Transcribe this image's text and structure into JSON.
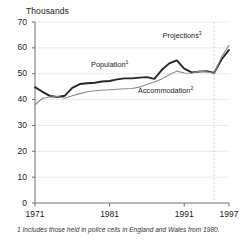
{
  "chart_data": {
    "type": "line",
    "title": "Thousands",
    "xlabel": "",
    "ylabel": "Thousands",
    "xlim": [
      1971,
      1997
    ],
    "ylim": [
      0,
      70
    ],
    "xticks": [
      "1971",
      "1981",
      "1991",
      "1997"
    ],
    "xtick_values": [
      1971,
      1981,
      1991,
      1997
    ],
    "yticks": [
      "0",
      "10",
      "20",
      "30",
      "40",
      "50",
      "60",
      "70"
    ],
    "ytick_values": [
      0,
      10,
      20,
      30,
      40,
      50,
      60,
      70
    ],
    "grid": true,
    "grid_axis": "y",
    "legend": "inline-annotations",
    "projection_start_year": 1995,
    "annotations": [
      {
        "text": "Projections",
        "superscript": "3",
        "x_year": 1991.6,
        "y_value": 64.5
      },
      {
        "text": "Population",
        "superscript": "1",
        "x_year": 1982.0,
        "y_value": 53.5
      },
      {
        "text": "Accommodation",
        "superscript": "2",
        "x_year": 1988.3,
        "y_value": 43.2
      }
    ],
    "x": [
      1971,
      1972,
      1973,
      1974,
      1975,
      1976,
      1977,
      1978,
      1979,
      1980,
      1981,
      1982,
      1983,
      1984,
      1985,
      1986,
      1987,
      1988,
      1989,
      1990,
      1991,
      1992,
      1993,
      1994,
      1995,
      1996,
      1997
    ],
    "series": [
      {
        "name": "Population",
        "superscript": "1",
        "color": "#262626",
        "width": 1.9,
        "values": [
          44.8,
          43.0,
          41.4,
          41.0,
          41.5,
          44.5,
          46.0,
          46.3,
          46.5,
          47.0,
          47.2,
          47.8,
          48.2,
          48.2,
          48.5,
          48.7,
          48.0,
          51.5,
          54.0,
          55.2,
          52.0,
          50.5,
          50.8,
          51.0,
          50.3,
          55.5,
          59.2
        ]
      },
      {
        "name": "Accommodation",
        "superscript": "2",
        "color": "#8a8a8a",
        "width": 1.1,
        "values": [
          38.0,
          40.5,
          41.0,
          41.2,
          40.5,
          41.5,
          42.3,
          43.0,
          43.4,
          43.6,
          43.8,
          44.0,
          44.2,
          44.3,
          44.8,
          45.8,
          46.8,
          48.0,
          49.6,
          51.0,
          50.3,
          50.2,
          51.0,
          50.7,
          50.2,
          56.5,
          61.0
        ]
      }
    ]
  },
  "footnote": {
    "text": "1 Includes those held in police cells in England and Wales from 1980."
  },
  "colors": {
    "population_line": "#262626",
    "accommodation_line": "#8a8a8a",
    "axis": "#6e6e6e",
    "grid": "#e3e3e3",
    "projection_divider": "#d0d0d0",
    "text": "#1a1a1a"
  }
}
